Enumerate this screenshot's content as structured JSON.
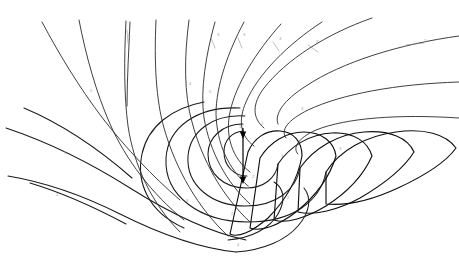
{
  "figure": {
    "background_color": "#ffffff",
    "line_color": "#1a1a1a",
    "label_color": "#9a9a9a",
    "width": 459,
    "height": 267,
    "center_x": 243,
    "center_y": 152
  },
  "center_marker": {
    "axis_label": "central axis",
    "arrow_count": 2,
    "arrow_direction": "down",
    "arrow_color": "#000000",
    "upper_arrow_y": 131,
    "lower_arrow_y": 176,
    "axis_top_y": 128,
    "axis_bottom_y": 182
  },
  "curve_labels": [
    {
      "id": "lbl-1",
      "text": "5",
      "x": 128,
      "y": 37
    },
    {
      "id": "lbl-2",
      "text": "3",
      "x": 217,
      "y": 36
    },
    {
      "id": "lbl-3",
      "text": "3",
      "x": 243,
      "y": 36
    },
    {
      "id": "lbl-4",
      "text": "3",
      "x": 279,
      "y": 40
    },
    {
      "id": "lbl-5",
      "text": "2",
      "x": 316,
      "y": 43
    },
    {
      "id": "lbl-6",
      "text": "2",
      "x": 424,
      "y": 42
    },
    {
      "id": "lbl-7",
      "text": "4",
      "x": 189,
      "y": 85
    },
    {
      "id": "lbl-8",
      "text": "5",
      "x": 209,
      "y": 93
    },
    {
      "id": "lbl-9",
      "text": "5",
      "x": 90,
      "y": 92
    },
    {
      "id": "lbl-10",
      "text": "3",
      "x": 301,
      "y": 110
    },
    {
      "id": "lbl-11",
      "text": "2",
      "x": 261,
      "y": 125
    },
    {
      "id": "lbl-12",
      "text": "1",
      "x": 239,
      "y": 128
    },
    {
      "id": "lbl-13",
      "text": "5",
      "x": 64,
      "y": 154
    },
    {
      "id": "lbl-14",
      "text": "3",
      "x": 339,
      "y": 150
    },
    {
      "id": "lbl-15",
      "text": "1",
      "x": 281,
      "y": 157
    },
    {
      "id": "lbl-16",
      "text": "2",
      "x": 252,
      "y": 178
    },
    {
      "id": "lbl-17",
      "text": "1",
      "x": 247,
      "y": 188
    },
    {
      "id": "lbl-18",
      "text": "2",
      "x": 287,
      "y": 199
    },
    {
      "id": "lbl-19",
      "text": "2",
      "x": 56,
      "y": 196
    },
    {
      "id": "lbl-20",
      "text": "3",
      "x": 186,
      "y": 202
    },
    {
      "id": "lbl-21",
      "text": "2",
      "x": 231,
      "y": 215
    },
    {
      "id": "lbl-22",
      "text": "4",
      "x": 237,
      "y": 246
    }
  ],
  "curve_ticks": [
    {
      "id": "tick-1",
      "x1": 211,
      "y1": 38,
      "x2": 215,
      "y2": 48
    },
    {
      "id": "tick-2",
      "x1": 238,
      "y1": 38,
      "x2": 242,
      "y2": 48
    },
    {
      "id": "tick-3",
      "x1": 273,
      "y1": 42,
      "x2": 279,
      "y2": 51
    },
    {
      "id": "tick-4",
      "x1": 308,
      "y1": 45,
      "x2": 318,
      "y2": 52
    },
    {
      "id": "tick-5",
      "x1": 406,
      "y1": 45,
      "x2": 424,
      "y2": 43
    },
    {
      "id": "tick-6",
      "x1": 127,
      "y1": 30,
      "x2": 128,
      "y2": 43
    }
  ],
  "streamlines": [
    {
      "id": "s-top-1",
      "name": "outer-left-descending",
      "d": "M 42,22 C 58,52 78,86 104,120 C 126,148 152,176 180,200"
    },
    {
      "id": "s-top-2",
      "name": "left-descending-2",
      "d": "M 79,20 C 86,56 96,92 110,124 C 126,160 152,194 184,220"
    },
    {
      "id": "s-top-3",
      "name": "left-vertical-fork",
      "d": "M 126,21 C 124,60 124,96 128,126 C 134,166 152,204 180,232"
    },
    {
      "id": "s-top-3b",
      "name": "left-vertical-fork-branch",
      "d": "M 130,22 C 129,48 127,78 127,106"
    },
    {
      "id": "s-top-4",
      "name": "center-vertical",
      "d": "M 156,20 C 154,62 156,100 164,128 C 176,170 198,208 228,236"
    },
    {
      "id": "s-top-5",
      "name": "inner-vertical-1",
      "d": "M 189,20 C 184,58 184,94 192,122 C 202,160 222,196 250,222"
    },
    {
      "id": "s-top-6",
      "name": "inner-vertical-2",
      "d": "M 215,22 C 206,54 200,90 204,118 C 210,152 226,182 250,204"
    },
    {
      "id": "s-top-7",
      "name": "inner-curving-1",
      "d": "M 244,22 C 228,52 216,86 216,114 C 217,144 228,168 248,186"
    },
    {
      "id": "s-top-8",
      "name": "inner-curving-2",
      "d": "M 281,24 C 256,52 236,84 230,112 C 225,136 232,158 250,172"
    },
    {
      "id": "s-top-9",
      "name": "inner-curving-3",
      "d": "M 322,22 C 288,44 258,74 246,102 C 238,120 240,136 254,146"
    },
    {
      "id": "s-top-10",
      "name": "upper-right-sweep",
      "d": "M 372,18 C 326,34 286,60 264,88 C 252,104 252,118 264,128"
    },
    {
      "id": "s-right-1",
      "name": "right-long-sweep",
      "d": "M 459,36 C 400,44 342,62 306,86 C 284,100 274,114 278,124"
    },
    {
      "id": "s-right-2",
      "name": "right-sweep-2",
      "d": "M 459,82 C 396,84 342,94 308,110 C 288,120 280,130 286,138"
    },
    {
      "id": "s-right-3",
      "name": "right-sweep-3",
      "d": "M 459,118 C 398,114 346,118 316,130 C 298,138 292,148 298,154"
    }
  ],
  "spiral_arms": [
    {
      "id": "arm-1",
      "name": "inner-spiral-core",
      "d": "M 243,131 C 232,132 224,140 224,152 C 224,166 234,176 247,176"
    },
    {
      "id": "arm-2",
      "name": "spiral-coil-2",
      "d": "M 243,124 C 222,124 208,138 208,154 C 208,174 224,188 246,188 C 264,188 276,178 278,164"
    },
    {
      "id": "arm-3",
      "name": "spiral-coil-3",
      "d": "M 245,116 C 212,114 190,132 188,156 C 186,186 212,206 246,206 C 276,206 296,190 300,168"
    },
    {
      "id": "arm-4",
      "name": "spiral-coil-4",
      "d": "M 240,108 C 196,106 168,128 166,158 C 164,196 200,222 248,222 C 292,222 320,202 326,172"
    },
    {
      "id": "arm-5",
      "name": "spiral-coil-5-lower",
      "d": "M 184,228 C 148,212 136,182 142,154 C 148,126 172,108 204,102"
    },
    {
      "id": "arm-6",
      "name": "lower-left-sweep-1",
      "d": "M 8,176 C 44,182 84,196 120,214 C 156,232 196,248 236,252"
    },
    {
      "id": "arm-7",
      "name": "lower-left-sweep-2",
      "d": "M 6,128 C 48,142 92,164 130,188 C 168,212 208,232 246,240"
    },
    {
      "id": "arm-8",
      "name": "lower-left-sweep-3",
      "d": "M 30,183 C 60,192 96,208 126,224"
    },
    {
      "id": "arm-9",
      "name": "lower-left-sweep-4",
      "d": "M 24,108 C 62,124 100,150 132,178"
    },
    {
      "id": "arm-10",
      "name": "bottom-curl",
      "d": "M 236,252 C 264,250 286,240 298,226 C 310,212 312,198 304,188"
    },
    {
      "id": "arm-11",
      "name": "bottom-inner-curl",
      "d": "M 228,240 C 252,238 270,228 278,214 C 286,200 284,188 274,182"
    }
  ],
  "lobes": [
    {
      "id": "lobe-1",
      "name": "lobe-outer-right",
      "d": "M 326,172 C 340,150 366,136 396,132 C 424,128 446,134 456,148 C 446,162 424,176 398,188 C 372,200 346,206 326,204 Z"
    },
    {
      "id": "lobe-2",
      "name": "lobe-right-2",
      "d": "M 300,168 C 314,148 338,134 364,132 C 390,130 408,138 414,152 C 404,168 384,184 360,198 C 338,210 314,216 298,212 Z"
    },
    {
      "id": "lobe-3",
      "name": "lobe-right-3",
      "d": "M 278,164 C 290,146 310,134 332,133 C 354,132 368,142 372,156 C 364,174 348,192 326,206 C 306,218 286,224 274,220 Z"
    },
    {
      "id": "lobe-4",
      "name": "lobe-right-4",
      "d": "M 260,158 C 270,142 286,132 304,132 C 322,132 334,142 336,156 C 330,176 316,196 296,212 C 278,226 260,232 250,228 Z"
    },
    {
      "id": "lobe-5",
      "name": "lobe-right-5",
      "d": "M 248,152 C 254,138 266,130 280,131 C 294,132 302,142 302,156 C 298,178 286,200 268,218 C 252,232 238,238 230,234 Z"
    }
  ]
}
